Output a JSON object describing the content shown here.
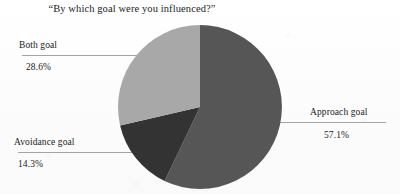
{
  "chart_data": {
    "type": "pie",
    "title": "“By which goal were you influenced?”",
    "xlabel": "",
    "ylabel": "",
    "legend_position": "none",
    "grid": false,
    "start_angle_deg": 0,
    "direction": "clockwise",
    "categories": [
      "Approach goal",
      "Avoidance goal",
      "Both goal"
    ],
    "values": [
      57.1,
      14.3,
      28.6
    ],
    "value_unit": "%",
    "slices": [
      {
        "label": "Approach goal",
        "value": 57.1,
        "value_text": "57.1%",
        "color": "#565656",
        "start_deg": 0,
        "end_deg": 205.56
      },
      {
        "label": "Avoidance goal",
        "value": 14.3,
        "value_text": "14.3%",
        "color": "#333333",
        "start_deg": 205.56,
        "end_deg": 257.04
      },
      {
        "label": "Both goal",
        "value": 28.6,
        "value_text": "28.6%",
        "color": "#a8a8a8",
        "start_deg": 257.04,
        "end_deg": 360
      }
    ]
  },
  "colors": {
    "approach": "#565656",
    "avoidance": "#333333",
    "both": "#a8a8a8",
    "leader_line": "#9a9a9a",
    "background": "#fdfdfd",
    "text": "#1b1b1b"
  }
}
